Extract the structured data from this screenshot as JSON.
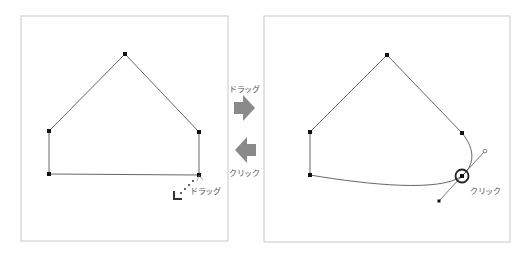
{
  "left_panel": {
    "title": "before",
    "drag_label": "ドラッグ"
  },
  "middle": {
    "forward_label": "ドラッグ",
    "back_label": "クリック",
    "forward_icon": "arrow-right-icon",
    "back_icon": "arrow-left-icon"
  },
  "right_panel": {
    "click_label": "クリック"
  },
  "colors": {
    "border": "#c8c8c8",
    "path": "#555555",
    "anchor": "#111111",
    "arrow": "#8a8a8a"
  }
}
